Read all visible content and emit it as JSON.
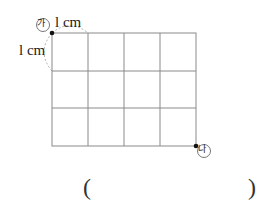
{
  "diagram": {
    "grid": {
      "columns": 4,
      "rows": 3,
      "cell_unit": "1 cm"
    },
    "labels": {
      "top_unit": "l cm",
      "side_unit": "l cm",
      "start_point": "가",
      "end_point": "나"
    },
    "answer": {
      "open": "(",
      "close": ")"
    }
  }
}
